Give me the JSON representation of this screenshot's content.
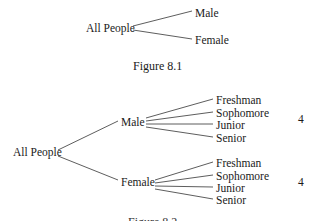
{
  "figure1": {
    "root": "All People",
    "branches": [
      "Male",
      "Female"
    ],
    "caption": "Figure 8.1"
  },
  "figure2": {
    "root": "All People",
    "branches": [
      {
        "label": "Male",
        "children": [
          "Freshman",
          "Sophomore",
          "Junior",
          "Senior"
        ],
        "count": "4"
      },
      {
        "label": "Female",
        "children": [
          "Freshman",
          "Sophomore",
          "Junior",
          "Senior"
        ],
        "count": "4"
      }
    ],
    "caption": "Figure 8.2"
  }
}
